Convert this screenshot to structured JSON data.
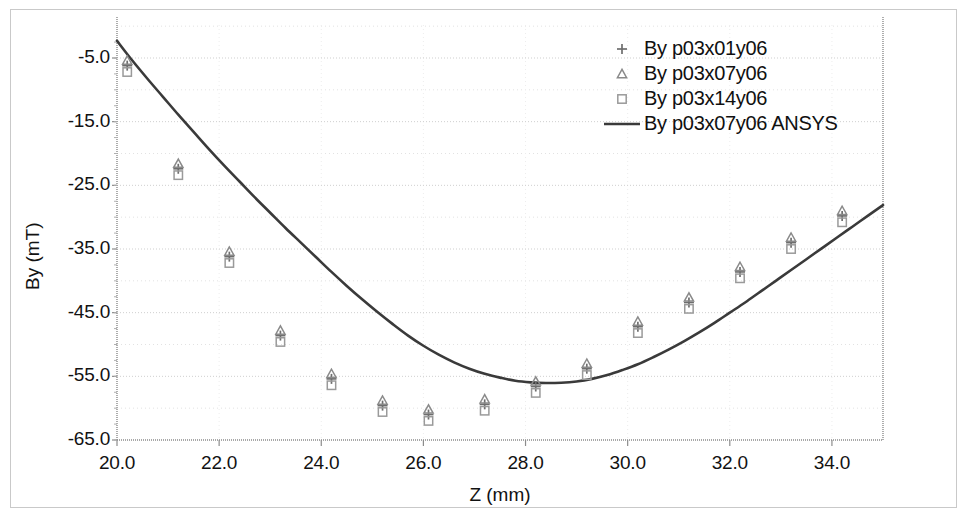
{
  "chart_data": {
    "type": "scatter",
    "title": "",
    "xlabel": "Z (mm)",
    "ylabel": "By (mT)",
    "xlim": [
      20.0,
      35.0
    ],
    "ylim": [
      -65.0,
      0.0
    ],
    "xticks": [
      "20.0",
      "22.0",
      "24.0",
      "26.0",
      "28.0",
      "30.0",
      "32.0",
      "34.0"
    ],
    "xtick_values": [
      20.0,
      22.0,
      24.0,
      26.0,
      28.0,
      30.0,
      32.0,
      34.0
    ],
    "yticks": [
      "-5.0",
      "-15.0",
      "-25.0",
      "-35.0",
      "-45.0",
      "-55.0",
      "-65.0"
    ],
    "ytick_values": [
      -5.0,
      -15.0,
      -25.0,
      -35.0,
      -45.0,
      -55.0,
      -65.0
    ],
    "grid": true,
    "grid_minor": true,
    "legend_position": "top-right",
    "x": [
      20.2,
      21.2,
      22.2,
      23.2,
      24.2,
      25.2,
      26.1,
      27.2,
      28.2,
      29.2,
      30.2,
      31.2,
      32.2,
      33.2,
      34.2
    ],
    "series": [
      {
        "name": "By p03x01y06",
        "marker": "plus",
        "color": "#6e6e6e",
        "values": [
          -6.2,
          -22.4,
          -36.2,
          -48.6,
          -55.4,
          -59.6,
          -61.0,
          -59.4,
          -56.6,
          -53.8,
          -47.2,
          -43.4,
          -38.6,
          -34.0,
          -29.8
        ]
      },
      {
        "name": "By p03x07y06",
        "marker": "triangle",
        "color": "#8a8a8a",
        "values": [
          -5.4,
          -21.6,
          -35.4,
          -47.8,
          -54.6,
          -58.8,
          -60.2,
          -58.6,
          -55.8,
          -53.0,
          -46.4,
          -42.6,
          -37.8,
          -33.2,
          -29.0
        ]
      },
      {
        "name": "By p03x14y06",
        "marker": "square",
        "color": "#9a9a9a",
        "values": [
          -7.2,
          -23.4,
          -37.2,
          -49.6,
          -56.4,
          -60.6,
          -62.0,
          -60.4,
          -57.6,
          -54.8,
          -48.2,
          -44.4,
          -39.6,
          -35.0,
          -30.8
        ]
      }
    ],
    "line_series": {
      "name": "By p03x07y06 ANSYS",
      "marker": "line",
      "color": "#3a3a3a",
      "points": [
        [
          20.0,
          -2.3
        ],
        [
          20.3,
          -5.4
        ],
        [
          20.6,
          -8.3
        ],
        [
          20.9,
          -11.1
        ],
        [
          21.2,
          -13.9
        ],
        [
          21.5,
          -16.6
        ],
        [
          21.8,
          -19.3
        ],
        [
          22.1,
          -21.9
        ],
        [
          22.4,
          -24.4
        ],
        [
          22.7,
          -26.9
        ],
        [
          23.0,
          -29.3
        ],
        [
          23.3,
          -31.7
        ],
        [
          23.6,
          -34.0
        ],
        [
          23.9,
          -36.3
        ],
        [
          24.2,
          -38.6
        ],
        [
          24.5,
          -40.8
        ],
        [
          24.8,
          -42.9
        ],
        [
          25.1,
          -44.9
        ],
        [
          25.4,
          -46.8
        ],
        [
          25.7,
          -48.6
        ],
        [
          26.0,
          -50.2
        ],
        [
          26.3,
          -51.6
        ],
        [
          26.6,
          -52.8
        ],
        [
          26.9,
          -53.8
        ],
        [
          27.2,
          -54.6
        ],
        [
          27.5,
          -55.2
        ],
        [
          27.8,
          -55.7
        ],
        [
          28.1,
          -55.95
        ],
        [
          28.4,
          -56.05
        ],
        [
          28.7,
          -56.0
        ],
        [
          29.0,
          -55.8
        ],
        [
          29.3,
          -55.4
        ],
        [
          29.6,
          -54.8
        ],
        [
          29.9,
          -54.0
        ],
        [
          30.2,
          -53.1
        ],
        [
          30.5,
          -52.0
        ],
        [
          30.8,
          -50.8
        ],
        [
          31.1,
          -49.5
        ],
        [
          31.4,
          -48.1
        ],
        [
          31.7,
          -46.6
        ],
        [
          32.0,
          -45.0
        ],
        [
          32.3,
          -43.4
        ],
        [
          32.6,
          -41.7
        ],
        [
          32.9,
          -40.0
        ],
        [
          33.2,
          -38.3
        ],
        [
          33.5,
          -36.6
        ],
        [
          33.8,
          -34.9
        ],
        [
          34.1,
          -33.2
        ],
        [
          34.4,
          -31.5
        ],
        [
          34.7,
          -29.8
        ],
        [
          35.0,
          -28.1
        ]
      ]
    }
  },
  "legend": {
    "entries": [
      {
        "label": "By p03x01y06",
        "marker": "plus"
      },
      {
        "label": "By p03x07y06",
        "marker": "triangle"
      },
      {
        "label": "By p03x14y06",
        "marker": "square"
      },
      {
        "label": "By p03x07y06 ANSYS",
        "marker": "line"
      }
    ]
  },
  "axes": {
    "x_title": "Z (mm)",
    "y_title": "By (mT)"
  },
  "colors": {
    "plot_line": "#3a3a3a",
    "grid": "#cfcfcf",
    "axis": "#8c8c8c",
    "frame": "#c9c9c9",
    "text": "#121212"
  }
}
